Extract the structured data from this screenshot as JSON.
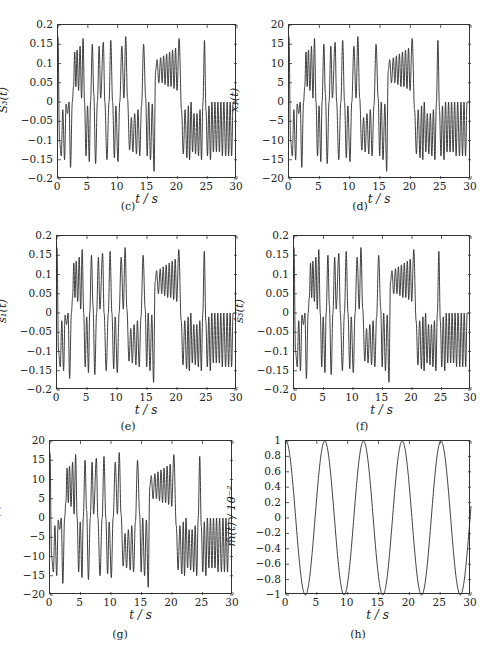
{
  "figure": {
    "panels": [
      {
        "id": "c",
        "caption": "(c)",
        "ylabel": "S₃(t)",
        "xlabel": "t / s"
      },
      {
        "id": "d",
        "caption": "(d)",
        "ylabel": "x₁(t)",
        "xlabel": "t / s"
      },
      {
        "id": "e",
        "caption": "(e)",
        "ylabel": "ŝ₁(t)",
        "xlabel": "t / s"
      },
      {
        "id": "f",
        "caption": "(f)",
        "ylabel": "ŝ₃(t)",
        "xlabel": "t / s"
      },
      {
        "id": "g",
        "caption": "(g)",
        "ylabel": "ŝ₆(t)",
        "xlabel": "t / s"
      },
      {
        "id": "h",
        "caption": "(h)",
        "ylabel": "m̂(t) / 10⁻²",
        "xlabel": "t / s"
      }
    ]
  },
  "chart_data": [
    {
      "id": "c",
      "type": "line",
      "title": "",
      "caption": "(c)",
      "xlabel": "t / s",
      "ylabel": "S3(t)",
      "xlim": [
        0,
        30
      ],
      "ylim": [
        -0.2,
        0.2
      ],
      "xticks": [
        0,
        5,
        10,
        15,
        20,
        25,
        30
      ],
      "yticks": [
        -0.2,
        -0.15,
        -0.1,
        -0.05,
        0,
        0.05,
        0.1,
        0.15,
        0.2
      ],
      "ytick_labels": [
        "−0.2",
        "−0.15",
        "−0.1",
        "−0.05",
        "0",
        "0.05",
        "0.1",
        "0.15",
        "0.2"
      ],
      "grid": false,
      "scale": 0.01,
      "series": [
        {
          "name": "S3(t)",
          "description": "chaotic signal, oscillations between about -0.18 and 0.17"
        }
      ]
    },
    {
      "id": "d",
      "type": "line",
      "title": "",
      "caption": "(d)",
      "xlabel": "t / s",
      "ylabel": "x1(t)",
      "xlim": [
        0,
        30
      ],
      "ylim": [
        -20,
        20
      ],
      "xticks": [
        0,
        5,
        10,
        15,
        20,
        25,
        30
      ],
      "yticks": [
        -20,
        -15,
        -10,
        -5,
        0,
        5,
        10,
        15,
        20
      ],
      "ytick_labels": [
        "−20",
        "−15",
        "−10",
        "−5",
        "0",
        "5",
        "10",
        "15",
        "20"
      ],
      "grid": false,
      "scale": 1,
      "series": [
        {
          "name": "x1(t)",
          "description": "chaotic Chua-like state, between about -18 and 17"
        }
      ]
    },
    {
      "id": "e",
      "type": "line",
      "title": "",
      "caption": "(e)",
      "xlabel": "t / s",
      "ylabel": "ŝ_1(t)",
      "xlim": [
        0,
        30
      ],
      "ylim": [
        -0.2,
        0.2
      ],
      "xticks": [
        0,
        5,
        10,
        15,
        20,
        25,
        30
      ],
      "yticks": [
        -0.2,
        -0.15,
        -0.1,
        -0.05,
        0,
        0.05,
        0.1,
        0.15,
        0.2
      ],
      "ytick_labels": [
        "−0.2",
        "−0.15",
        "−0.1",
        "−0.05",
        "0",
        "0.05",
        "0.1",
        "0.15",
        "0.2"
      ],
      "grid": false,
      "scale": 0.01,
      "series": [
        {
          "name": "ŝ_1(t)",
          "description": "recovered signal matching (c)"
        }
      ]
    },
    {
      "id": "f",
      "type": "line",
      "title": "",
      "caption": "(f)",
      "xlabel": "t / s",
      "ylabel": "ŝ_3(t)",
      "xlim": [
        0,
        30
      ],
      "ylim": [
        -0.2,
        0.2
      ],
      "xticks": [
        0,
        5,
        10,
        15,
        20,
        25,
        30
      ],
      "yticks": [
        -0.2,
        -0.15,
        -0.1,
        -0.05,
        0,
        0.05,
        0.1,
        0.15,
        0.2
      ],
      "ytick_labels": [
        "−0.2",
        "−0.15",
        "−0.1",
        "−0.05",
        "0",
        "0.05",
        "0.1",
        "0.15",
        "0.2"
      ],
      "grid": false,
      "scale": 0.01,
      "series": [
        {
          "name": "ŝ_3(t)",
          "description": "recovered signal matching (c)"
        }
      ]
    },
    {
      "id": "g",
      "type": "line",
      "title": "",
      "caption": "(g)",
      "xlabel": "t / s",
      "ylabel": "ŝ_6(t)",
      "xlim": [
        0,
        30
      ],
      "ylim": [
        -20,
        20
      ],
      "xticks": [
        0,
        5,
        10,
        15,
        20,
        25,
        30
      ],
      "yticks": [
        -20,
        -15,
        -10,
        -5,
        0,
        5,
        10,
        15,
        20
      ],
      "ytick_labels": [
        "−20",
        "−15",
        "−10",
        "−5",
        "0",
        "5",
        "10",
        "15",
        "20"
      ],
      "grid": false,
      "scale": 1,
      "series": [
        {
          "name": "ŝ_6(t)",
          "description": "recovered signal matching (d)"
        }
      ]
    },
    {
      "id": "h",
      "type": "line",
      "title": "",
      "caption": "(h)",
      "xlabel": "t / s",
      "ylabel": "m̂(t) / 10^-2",
      "xlim": [
        0,
        30
      ],
      "ylim": [
        -1,
        1
      ],
      "xticks": [
        0,
        5,
        10,
        15,
        20,
        25,
        30
      ],
      "yticks": [
        -1,
        -0.8,
        -0.6,
        -0.4,
        -0.2,
        0,
        0.2,
        0.4,
        0.6,
        0.8,
        1
      ],
      "ytick_labels": [
        "−1",
        "−0.8",
        "−0.6",
        "−0.4",
        "−0.2",
        "0",
        "0.2",
        "0.4",
        "0.6",
        "0.8",
        "1"
      ],
      "grid": false,
      "series": [
        {
          "name": "m̂(t)",
          "x": [
            0,
            3.14,
            6.28,
            9.42,
            12.57,
            15.71,
            18.85,
            21.99,
            25.13,
            28.27,
            30
          ],
          "values": [
            1,
            -1,
            1,
            -1,
            1,
            -1,
            1,
            -1,
            1,
            -1,
            0.15
          ],
          "description": "cos(t), amplitude 1"
        }
      ]
    }
  ],
  "chaos_profile": {
    "t": [
      0,
      0.25,
      0.55,
      0.8,
      1.1,
      1.35,
      1.6,
      1.85,
      2.1,
      2.4,
      2.6,
      2.8,
      3.0,
      3.2,
      3.45,
      3.7,
      3.95,
      4.2,
      4.45,
      4.7,
      4.95,
      5.25,
      5.45,
      5.75,
      6.0,
      6.3,
      6.6,
      6.9,
      7.15,
      7.6,
      7.85,
      8.2,
      8.55,
      8.85,
      9.15,
      9.45,
      9.7,
      10.05,
      10.35,
      10.7,
      11.05,
      11.35,
      11.65,
      12.0,
      12.3,
      12.55,
      12.85,
      13.15,
      13.4,
      13.7,
      14.0,
      14.35,
      14.7,
      14.95,
      15.2,
      15.5,
      15.8,
      16.1,
      16.35,
      16.6,
      16.9,
      17.2,
      17.45,
      17.7,
      17.95,
      18.2,
      18.45,
      18.7,
      18.95,
      19.2,
      19.45,
      19.7,
      19.95,
      20.3,
      20.7,
      21.0,
      21.3,
      21.6,
      21.85,
      22.05,
      22.3,
      22.55,
      22.8,
      23.05,
      23.3,
      23.55,
      23.8,
      24.05,
      24.3,
      24.55,
      24.8,
      25.05,
      25.3,
      25.55,
      25.8,
      26.05,
      26.3,
      26.55,
      26.8,
      27.05,
      27.3,
      27.55,
      27.8,
      28.1,
      28.35,
      28.6,
      28.85,
      29.1,
      29.35,
      29.6,
      29.85,
      30
    ],
    "v": [
      17,
      -10,
      -14,
      -2,
      -15,
      -0.5,
      -3,
      0,
      -17,
      0,
      4,
      13,
      4,
      13.5,
      3,
      14.5,
      1,
      16.5,
      0,
      -14,
      -1,
      -15.5,
      0,
      15,
      2,
      -16,
      0,
      14.5,
      1,
      15.5,
      0,
      -15,
      0,
      16,
      0,
      -14.5,
      -1,
      -15.5,
      0,
      14.5,
      1,
      17,
      1,
      -12.5,
      -4,
      -13,
      -3,
      -13.5,
      -2,
      -14,
      -1,
      15,
      1,
      -14,
      0,
      -15,
      -0.5,
      -18,
      8,
      11,
      5,
      11.5,
      5,
      12,
      4.5,
      12.5,
      4,
      13,
      4,
      13.5,
      3.5,
      14,
      3,
      16.5,
      -2,
      -13.5,
      -2,
      -14.5,
      -1,
      -15,
      0,
      -13,
      -3,
      -13.5,
      -3,
      -14,
      -2,
      -15,
      0,
      16,
      -2,
      -14,
      -1,
      -15,
      0,
      -13,
      0,
      -13,
      0,
      -13,
      0,
      -14,
      0,
      -14,
      0,
      -14,
      0,
      -14,
      0,
      0
    ]
  }
}
